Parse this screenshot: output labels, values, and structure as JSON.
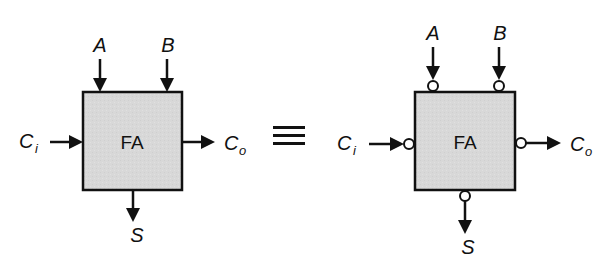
{
  "diagram": {
    "left_block": {
      "label": "FA",
      "inputs": {
        "a": "A",
        "b": "B",
        "ci_main": "C",
        "ci_sub": "i"
      },
      "outputs": {
        "co_main": "C",
        "co_sub": "o",
        "s": "S"
      },
      "inverted_pins": false
    },
    "equivalence_symbol": "≡",
    "right_block": {
      "label": "FA",
      "inputs": {
        "a": "A",
        "b": "B",
        "ci_main": "C",
        "ci_sub": "i"
      },
      "outputs": {
        "co_main": "C",
        "co_sub": "o",
        "s": "S"
      },
      "inverted_pins": true
    },
    "colors": {
      "box_fill": "#d6d6d6",
      "stroke": "#111111",
      "background": "#ffffff"
    }
  }
}
